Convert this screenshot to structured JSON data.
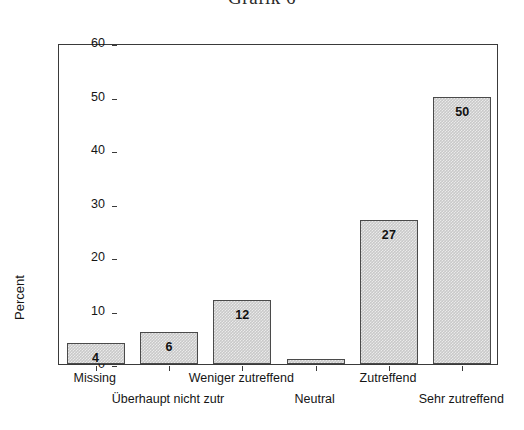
{
  "chart_data": {
    "type": "bar",
    "title": "Grafik 6",
    "xlabel": "",
    "ylabel": "Percent",
    "ylim": [
      0,
      60
    ],
    "yticks": [
      0,
      10,
      20,
      30,
      40,
      50,
      60
    ],
    "grid": false,
    "legend": null,
    "categories": [
      "Missing",
      "Überhaupt nicht zutr",
      "Weniger zutreffend",
      "Neutral",
      "Zutreffend",
      "Sehr zutreffend"
    ],
    "values": [
      4,
      6,
      12,
      1,
      27,
      50
    ],
    "data_labels": [
      "4",
      "6",
      "12",
      "",
      "27",
      "50"
    ],
    "bar_color": "#c9c9c9",
    "bar_edge_color": "#4a4a4a",
    "label_rows": [
      "top",
      "bottom",
      "top",
      "bottom",
      "top",
      "bottom"
    ],
    "axis_color": "#3a3a3a",
    "text_color": "#151515"
  }
}
